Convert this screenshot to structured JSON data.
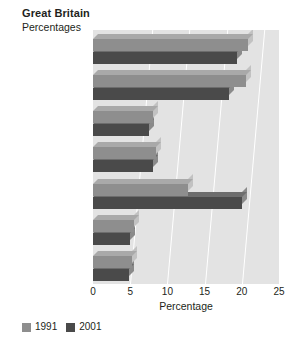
{
  "chart_data": {
    "type": "bar",
    "orientation": "horizontal",
    "title": "Great Britain",
    "subtitle": "Percentages",
    "xlabel": "Percentage",
    "ylabel": "",
    "xlim": [
      0,
      25
    ],
    "xticks": [
      0,
      5,
      10,
      15,
      20,
      25
    ],
    "xticklabels": [
      "0",
      "5",
      "10",
      "15",
      "20",
      "25"
    ],
    "grid": true,
    "legend_position": "bottom-left",
    "categories": [
      "Black Caribbean",
      "Black African",
      "Bangladeshi",
      "Pakistani",
      "White",
      "Chinese",
      "Indian"
    ],
    "series": [
      {
        "name": "1991",
        "color": "#8e8e8e",
        "values": [
          20.8,
          20.5,
          8.0,
          8.5,
          12.8,
          5.5,
          5.2
        ]
      },
      {
        "name": "2001",
        "color": "#4a4a4a",
        "values": [
          19.3,
          18.3,
          7.5,
          8.0,
          20.0,
          5.0,
          4.8
        ]
      }
    ]
  },
  "legend": {
    "items": [
      {
        "label": "1991",
        "color": "#8e8e8e"
      },
      {
        "label": "2001",
        "color": "#4a4a4a"
      }
    ]
  }
}
